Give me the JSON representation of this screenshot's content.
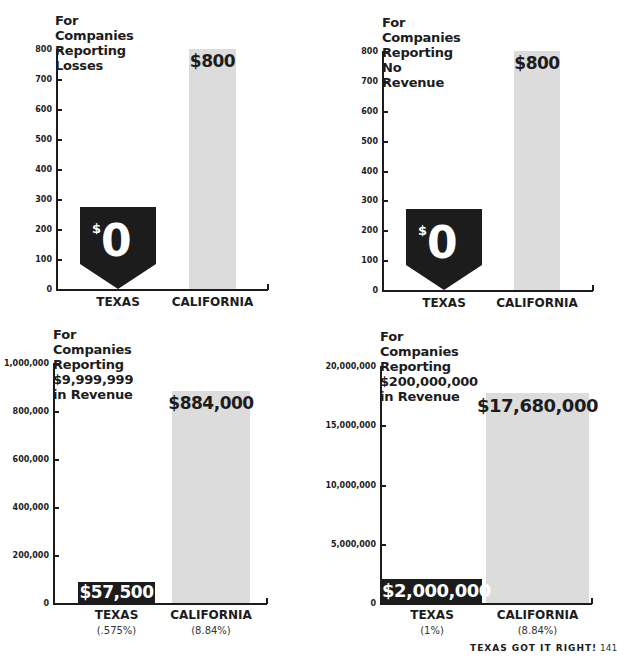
{
  "chart_data": [
    {
      "type": "bar",
      "title": "For Companies Reporting\nLosses",
      "categories": [
        "TEXAS",
        "CALIFORNIA"
      ],
      "values": [
        0,
        800
      ],
      "value_labels": [
        "$0",
        "$800"
      ],
      "ylim": [
        0,
        800
      ],
      "yticks": [
        "0",
        "100",
        "200",
        "300",
        "400",
        "500",
        "600",
        "700",
        "800"
      ],
      "xlabel": "",
      "ylabel": "",
      "grid": false
    },
    {
      "type": "bar",
      "title": "For Companies Reporting\nNo Revenue",
      "categories": [
        "TEXAS",
        "CALIFORNIA"
      ],
      "values": [
        0,
        800
      ],
      "value_labels": [
        "$0",
        "$800"
      ],
      "ylim": [
        0,
        800
      ],
      "yticks": [
        "0",
        "100",
        "200",
        "300",
        "400",
        "500",
        "600",
        "700",
        "800"
      ],
      "xlabel": "",
      "ylabel": "",
      "grid": false
    },
    {
      "type": "bar",
      "title": "For Companies Reporting\n$9,999,999 in Revenue",
      "categories": [
        "TEXAS",
        "CALIFORNIA"
      ],
      "category_notes": [
        "(.575%)",
        "(8.84%)"
      ],
      "values": [
        57500,
        884000
      ],
      "value_labels": [
        "$57,500",
        "$884,000"
      ],
      "ylim": [
        0,
        1000000
      ],
      "yticks": [
        "0",
        "200,000",
        "400,000",
        "600,000",
        "800,000",
        "1,000,000"
      ],
      "xlabel": "",
      "ylabel": "",
      "grid": false
    },
    {
      "type": "bar",
      "title": "For Companies Reporting\n$200,000,000 in Revenue",
      "categories": [
        "TEXAS",
        "CALIFORNIA"
      ],
      "category_notes": [
        "(1%)",
        "(8.84%)"
      ],
      "values": [
        2000000,
        17680000
      ],
      "value_labels": [
        "$2,000,000",
        "$17,680,000"
      ],
      "ylim": [
        0,
        20000000
      ],
      "yticks": [
        "0",
        "5,000,000",
        "10,000,000",
        "15,000,000",
        "20,000,000"
      ],
      "xlabel": "",
      "ylabel": "",
      "grid": false
    }
  ],
  "colors": {
    "texas": "#1c1c1c",
    "california": "#dcdcdc",
    "text": "#1c1c1c"
  },
  "footer": {
    "text": "TEXAS GOT IT RIGHT!",
    "page_number": "141"
  }
}
